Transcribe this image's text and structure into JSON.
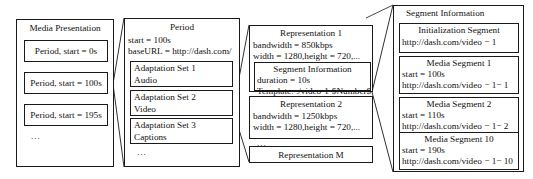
{
  "diagram": {
    "title_hidden": "MPEG-DASH Media Presentation Description hierarchy",
    "ellipsis": "...",
    "media_presentation": {
      "title": "Media Presentation",
      "periods": [
        {
          "label": "Period, start = 0s"
        },
        {
          "label": "Period, start = 100s"
        },
        {
          "label": "Period, start = 195s"
        }
      ]
    },
    "period": {
      "title": "Period",
      "attributes": [
        "start = 100s",
        "baseURL = http://dash.com/"
      ],
      "adaptation_sets": [
        {
          "name": "Adaptation Set 1",
          "type": "Audio"
        },
        {
          "name": "Adaptation Set 2",
          "type": "Video"
        },
        {
          "name": "Adaptation Set 3",
          "type": "Captions"
        }
      ]
    },
    "representations": {
      "rep1": {
        "title": "Representation 1",
        "attributes": [
          "bandwidth = 850kbps",
          "width = 1280,height = 720,..."
        ],
        "segment_information": {
          "title": "Segment Information",
          "attributes": [
            "duration = 10s",
            "Template: ./video-1-$Number$"
          ]
        }
      },
      "rep2": {
        "title": "Representation 2",
        "attributes": [
          "bandwidth = 1250kbps",
          "width = 1280,height = 720,..."
        ]
      },
      "repM": {
        "title": "Representation M"
      }
    },
    "segment_information": {
      "title": "Segment Information",
      "initialization_segment": {
        "title": "Initialization Segment",
        "url": "http://dash.com/video − 1"
      },
      "media_segments": [
        {
          "title": "Media Segment 1",
          "start": "start = 100s",
          "url": "http://dash.com/video − 1− 1"
        },
        {
          "title": "Media Segment 2",
          "start": "start = 110s",
          "url": "http://dash.com/video − 1− 2"
        },
        {
          "title": "Media Segment 10",
          "start": "start = 190s",
          "url": "http://dash.com/video − 1− 10"
        }
      ]
    }
  }
}
